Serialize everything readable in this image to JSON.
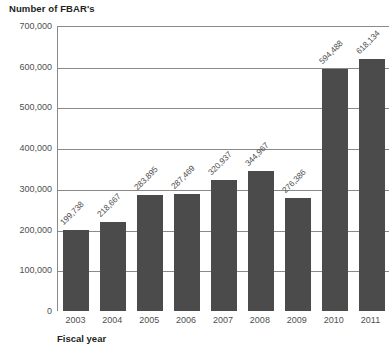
{
  "chart_data": {
    "type": "bar",
    "title": "Number of FBAR's",
    "xlabel": "Fiscal year",
    "ylabel": "Number of FBAR's",
    "categories": [
      "2003",
      "2004",
      "2005",
      "2006",
      "2007",
      "2008",
      "2009",
      "2010",
      "2011"
    ],
    "values": [
      199738,
      218667,
      283895,
      287469,
      320937,
      344967,
      276386,
      594488,
      618134
    ],
    "value_labels": [
      "199,738",
      "218,667",
      "283,895",
      "287,469",
      "320,937",
      "344,967",
      "276,386",
      "594,488",
      "618,134"
    ],
    "ylim": [
      0,
      700000
    ],
    "ytick_values": [
      0,
      100000,
      200000,
      300000,
      400000,
      500000,
      600000,
      700000
    ],
    "ytick_labels": [
      "0",
      "100,000",
      "200,000",
      "300,000",
      "400,000",
      "500,000",
      "600,000",
      "700,000"
    ],
    "grid": true,
    "legend": false,
    "bar_color": "#4b4b4b",
    "axis_color": "#8a8a8a",
    "label_rotation": -45
  }
}
